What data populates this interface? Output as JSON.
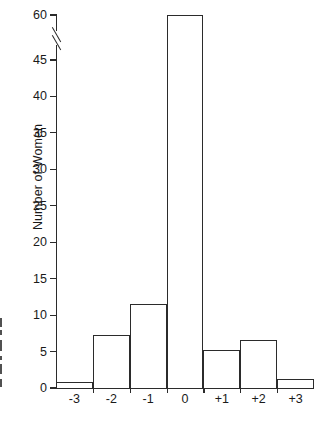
{
  "figure": {
    "background_color": "#ffffff",
    "line_color": "#2b2b2b",
    "ylabel": "Number of Women",
    "axis_break_note": "double-slash break between 45 and 60"
  },
  "chart_data": {
    "type": "bar",
    "title": "",
    "xlabel": "",
    "ylabel": "Number of Women",
    "categories": [
      "-3",
      "-2",
      "-1",
      "0",
      "+1",
      "+2",
      "+3"
    ],
    "values": [
      0.8,
      7.3,
      11.5,
      60,
      5.3,
      6.6,
      1.3
    ],
    "ylim": [
      0,
      60
    ],
    "yticks": [
      0,
      5,
      10,
      15,
      20,
      25,
      30,
      35,
      40,
      45,
      60
    ],
    "ytick_labels": [
      "0",
      "5",
      "10",
      "15",
      "20",
      "25",
      "30",
      "35",
      "40",
      "45",
      "60"
    ],
    "axis_break": {
      "below": 45,
      "above": 60,
      "style": "double-slash"
    },
    "grid": false,
    "legend": null
  },
  "edge_artifacts": [
    {
      "top": 0,
      "height": 9,
      "width": 2.2
    },
    {
      "top": 12,
      "height": 5,
      "width": 1.6
    },
    {
      "top": 22,
      "height": 11,
      "width": 2.4
    },
    {
      "top": 38,
      "height": 4,
      "width": 1.5
    },
    {
      "top": 46,
      "height": 10,
      "width": 2.3
    },
    {
      "top": 61,
      "height": 8,
      "width": 2.0
    }
  ]
}
